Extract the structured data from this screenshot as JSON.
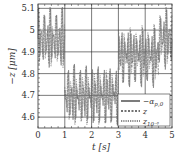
{
  "chart_data": {
    "type": "line",
    "title": "",
    "xlabel": "t [s]",
    "ylabel": "−z [μm]",
    "xlim": [
      0,
      5
    ],
    "ylim": [
      4.55,
      5.12
    ],
    "xticks": [
      0,
      1,
      2,
      3,
      4,
      5
    ],
    "xtick_labels": [
      "0",
      "1",
      "2",
      "3",
      "4",
      "5"
    ],
    "yticks": [
      4.6,
      4.7,
      4.8,
      4.9,
      5.0,
      5.1
    ],
    "ytick_labels": [
      "4.6",
      "4.7",
      "4.8",
      "4.9",
      "5",
      "5.1"
    ],
    "grid": true,
    "legend_position": "lower right",
    "series": [
      {
        "name": "−α_{p,0}",
        "style": "solid",
        "segments": [
          {
            "t": [
              0,
              1
            ],
            "center": 4.96,
            "amplitude": 0.13
          },
          {
            "t": [
              1,
              3
            ],
            "center": 4.7,
            "amplitude": 0.13
          },
          {
            "t": [
              3,
              4.5
            ],
            "center": 4.88,
            "amplitude": 0.13
          },
          {
            "t": [
              4.5,
              5
            ],
            "center": 4.96,
            "amplitude": 0.13
          }
        ]
      },
      {
        "name": "z",
        "style": "dashed",
        "segments": [
          {
            "t": [
              0,
              1
            ],
            "center": 4.96,
            "amplitude": 0.13
          },
          {
            "t": [
              1,
              3
            ],
            "center": 4.7,
            "amplitude": 0.13
          },
          {
            "t": [
              3,
              4.5
            ],
            "center": 4.88,
            "amplitude": 0.13
          },
          {
            "t": [
              4.5,
              5
            ],
            "center": 4.96,
            "amplitude": 0.13
          }
        ]
      },
      {
        "name": "z_{10^-6}",
        "style": "dotted",
        "segments": [
          {
            "t": [
              0,
              1
            ],
            "center": 4.96,
            "amplitude": 0.13
          },
          {
            "t": [
              1,
              3
            ],
            "center": 4.7,
            "amplitude": 0.13
          },
          {
            "t": [
              3,
              4.5
            ],
            "center": 4.88,
            "amplitude": 0.13
          },
          {
            "t": [
              4.5,
              5
            ],
            "center": 4.96,
            "amplitude": 0.13
          }
        ]
      }
    ]
  },
  "legend": {
    "items": [
      {
        "label": "−α",
        "sub": "p,0",
        "style": "solid"
      },
      {
        "label": "z",
        "sub": "",
        "style": "dashed"
      },
      {
        "label": "z",
        "sub": "10⁻⁶",
        "style": "dotted"
      }
    ]
  },
  "colors": {
    "trace": "#6e6e6e",
    "grid": "#222222",
    "axis": "#333333"
  }
}
